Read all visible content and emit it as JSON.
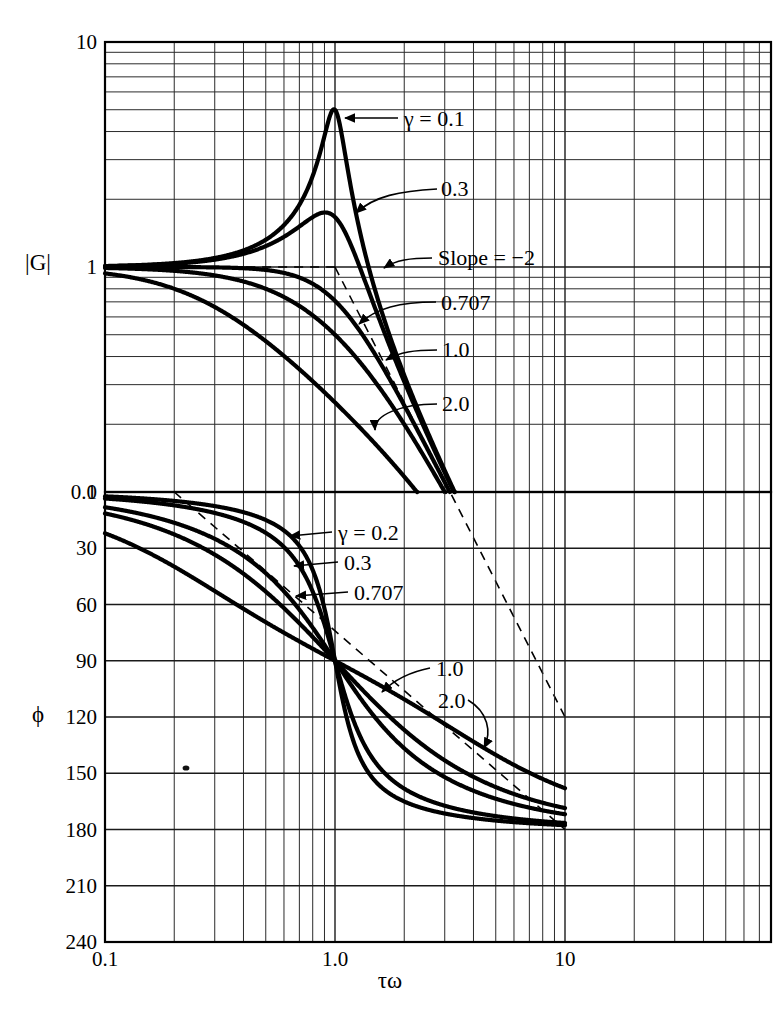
{
  "magnitude_panel": {
    "y_axis_title": "|G|",
    "y_ticks": [
      "10",
      "1",
      "0.1"
    ],
    "labels": [
      {
        "text": "γ = 0.1",
        "id": "gamma-0-1"
      },
      {
        "text": "0.3",
        "id": "gamma-0-3"
      },
      {
        "text": "Slope = −2",
        "id": "slope-note"
      },
      {
        "text": "0.707",
        "id": "gamma-0-707"
      },
      {
        "text": "1.0",
        "id": "gamma-1-0"
      },
      {
        "text": "2.0",
        "id": "gamma-2-0"
      }
    ]
  },
  "phase_panel": {
    "y_axis_title": "ϕ",
    "y_ticks": [
      "0",
      "30",
      "60",
      "90",
      "120",
      "150",
      "180",
      "210",
      "240"
    ],
    "labels": [
      {
        "text": "γ = 0.2",
        "id": "gamma-0-2"
      },
      {
        "text": "0.3",
        "id": "gamma-0-3"
      },
      {
        "text": "0.707",
        "id": "gamma-0-707"
      },
      {
        "text": "1.0",
        "id": "gamma-1-0"
      },
      {
        "text": "2.0",
        "id": "gamma-2-0"
      }
    ]
  },
  "x_axis": {
    "title": "τω",
    "ticks": [
      "0.1",
      "1.0",
      "10"
    ]
  },
  "chart_data": {
    "type": "line",
    "title": "",
    "subtitle": "",
    "xlabel": "τω",
    "xscale": "log",
    "xlim": [
      0.1,
      40
    ],
    "xticks": [
      0.1,
      1.0,
      10
    ],
    "xticklabels": [
      "0.1",
      "1.0",
      "10"
    ],
    "grid": true,
    "legend": "inline-annotations",
    "panels": [
      {
        "name": "magnitude",
        "ylabel": "|G|",
        "yscale": "log",
        "ylim": [
          0.1,
          10
        ],
        "yticks": [
          0.1,
          1,
          10
        ],
        "yticklabels": [
          "0.1",
          "1",
          "10"
        ],
        "formula": "|G| = 1 / sqrt((1 - (tau*omega)^2)^2 + (2*gamma*tau*omega)^2)",
        "series": [
          {
            "name": "γ = 0.1",
            "gamma": 0.1,
            "x": [
              0.1,
              0.2,
              0.3,
              0.5,
              0.7,
              0.8,
              0.9,
              0.95,
              1.0,
              1.05,
              1.1,
              1.2,
              1.5,
              2.0,
              3.0,
              5.0,
              10.0
            ],
            "y": [
              1.01,
              1.04,
              1.1,
              1.33,
              1.93,
              2.68,
              4.42,
              5.2,
              5.0,
              4.16,
              3.18,
              1.97,
              0.77,
              0.33,
              0.125,
              0.0417,
              0.0101
            ],
            "peak": {
              "x": 1.0,
              "y": 5.0
            }
          },
          {
            "name": "0.3",
            "gamma": 0.3,
            "x": [
              0.1,
              0.2,
              0.3,
              0.5,
              0.7,
              0.8,
              0.9,
              1.0,
              1.1,
              1.2,
              1.5,
              2.0,
              3.0,
              5.0,
              10.0
            ],
            "y": [
              1.01,
              1.03,
              1.07,
              1.23,
              1.49,
              1.62,
              1.7,
              1.667,
              1.5,
              1.27,
              0.79,
              0.39,
              0.13,
              0.042,
              0.0101
            ],
            "peak": {
              "x": 0.905,
              "y": 1.747
            }
          },
          {
            "name": "0.707",
            "gamma": 0.707,
            "x": [
              0.1,
              0.3,
              0.5,
              0.7,
              1.0,
              1.5,
              2.0,
              3.0,
              5.0,
              10.0
            ],
            "y": [
              1.0,
              0.995,
              0.97,
              0.92,
              0.707,
              0.39,
              0.236,
              0.11,
              0.04,
              0.0099
            ],
            "peak": null
          },
          {
            "name": "1.0",
            "gamma": 1.0,
            "x": [
              0.1,
              0.3,
              0.5,
              0.7,
              1.0,
              1.5,
              2.0,
              3.0,
              5.0,
              10.0
            ],
            "y": [
              0.99,
              0.917,
              0.8,
              0.672,
              0.5,
              0.308,
              0.2,
              0.1,
              0.0385,
              0.0098
            ],
            "peak": null
          },
          {
            "name": "2.0",
            "gamma": 2.0,
            "x": [
              0.1,
              0.3,
              0.5,
              0.7,
              1.0,
              1.5,
              2.0,
              3.0,
              5.0,
              10.0
            ],
            "y": [
              0.93,
              0.68,
              0.49,
              0.37,
              0.25,
              0.155,
              0.108,
              0.057,
              0.024,
              0.0071
            ],
            "peak": null
          }
        ],
        "annotations": [
          {
            "text": "Slope = −2",
            "type": "asymptote-label"
          },
          {
            "text": "asymptote",
            "type": "dashed-line",
            "from": [
              1.0,
              1.0
            ],
            "to": [
              10.0,
              0.01
            ]
          }
        ]
      },
      {
        "name": "phase",
        "ylabel": "ϕ",
        "yscale": "linear",
        "ylim": [
          0,
          240
        ],
        "yticks": [
          0,
          30,
          60,
          90,
          120,
          150,
          180,
          210,
          240
        ],
        "yticklabels": [
          "0",
          "30",
          "60",
          "90",
          "120",
          "150",
          "180",
          "210",
          "240"
        ],
        "y_inverted": true,
        "units": "degrees",
        "formula": "phi = atan2(2*gamma*tau*omega, 1 - (tau*omega)^2)",
        "series": [
          {
            "name": "γ = 0.2",
            "gamma": 0.2,
            "x": [
              0.1,
              0.2,
              0.3,
              0.5,
              0.7,
              0.9,
              1.0,
              1.1,
              1.3,
              1.5,
              2.0,
              3.0,
              5.0,
              10.0
            ],
            "y": [
              2.3,
              4.8,
              7.9,
              15.0,
              28.4,
              62.4,
              90.0,
              117.6,
              148.0,
              158.2,
              165.1,
              171.4,
              175.2,
              177.7
            ]
          },
          {
            "name": "0.3",
            "gamma": 0.3,
            "x": [
              0.1,
              0.2,
              0.3,
              0.5,
              0.7,
              0.9,
              1.0,
              1.1,
              1.3,
              1.5,
              2.0,
              3.0,
              5.0,
              10.0
            ],
            "y": [
              3.5,
              7.1,
              11.8,
              21.8,
              39.5,
              72.5,
              90.0,
              107.5,
              140.5,
              152.3,
              161.6,
              167.8,
              172.8,
              176.5
            ]
          },
          {
            "name": "0.707",
            "gamma": 0.707,
            "x": [
              0.1,
              0.2,
              0.3,
              0.5,
              0.7,
              0.9,
              1.0,
              1.1,
              1.3,
              1.5,
              2.0,
              3.0,
              5.0,
              10.0
            ],
            "y": [
              8.1,
              16.6,
              25.0,
              43.3,
              65.8,
              84.1,
              90.0,
              105.9,
              130.4,
              139.0,
              153.4,
              162.8,
              170.0,
              174.8
            ]
          },
          {
            "name": "1.0",
            "gamma": 1.0,
            "x": [
              0.1,
              0.2,
              0.3,
              0.5,
              0.7,
              0.9,
              1.0,
              1.1,
              1.3,
              1.5,
              2.0,
              3.0,
              5.0,
              10.0
            ],
            "y": [
              11.4,
              23.1,
              33.4,
              53.1,
              73.4,
              84.8,
              90.0,
              101.3,
              122.4,
              134.8,
              143.1,
              143.1,
              157.4,
              167.3
            ]
          },
          {
            "name": "2.0",
            "gamma": 2.0,
            "x": [
              0.1,
              0.2,
              0.3,
              0.5,
              0.7,
              0.9,
              1.0,
              1.1,
              1.3,
              1.5,
              2.0,
              3.0,
              5.0,
              10.0
            ],
            "y": [
              22.0,
              40.6,
              54.8,
              73.0,
              82.0,
              88.0,
              90.0,
              99.2,
              118.3,
              125.2,
              133.0,
              146.3,
              155.0,
              164.0
            ]
          }
        ],
        "annotations": [
          {
            "text": "asymptote",
            "type": "dashed-line",
            "from": [
              0.2,
              0.0
            ],
            "to": [
              10.0,
              180.0
            ]
          }
        ]
      }
    ]
  }
}
